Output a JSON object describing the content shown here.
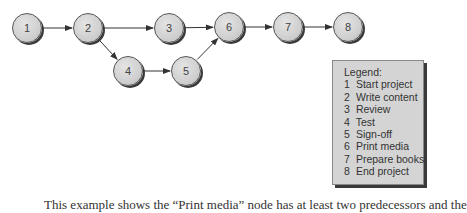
{
  "diagram": {
    "type": "network-diagram",
    "nodes": [
      {
        "id": "1",
        "label": "1",
        "x": 27,
        "y": 28
      },
      {
        "id": "2",
        "label": "2",
        "x": 88,
        "y": 28
      },
      {
        "id": "3",
        "label": "3",
        "x": 169,
        "y": 28
      },
      {
        "id": "4",
        "label": "4",
        "x": 128,
        "y": 71
      },
      {
        "id": "5",
        "label": "5",
        "x": 186,
        "y": 71
      },
      {
        "id": "6",
        "label": "6",
        "x": 229,
        "y": 27
      },
      {
        "id": "7",
        "label": "7",
        "x": 288,
        "y": 27
      },
      {
        "id": "8",
        "label": "8",
        "x": 348,
        "y": 27
      }
    ],
    "edges": [
      {
        "from": "1",
        "to": "2"
      },
      {
        "from": "2",
        "to": "3"
      },
      {
        "from": "2",
        "to": "4"
      },
      {
        "from": "3",
        "to": "6"
      },
      {
        "from": "4",
        "to": "5"
      },
      {
        "from": "5",
        "to": "6"
      },
      {
        "from": "6",
        "to": "7"
      },
      {
        "from": "7",
        "to": "8"
      }
    ]
  },
  "legend": {
    "title": "Legend:",
    "items": [
      {
        "num": "1",
        "label": "Start project"
      },
      {
        "num": "2",
        "label": "Write content"
      },
      {
        "num": "3",
        "label": "Review"
      },
      {
        "num": "4",
        "label": "Test"
      },
      {
        "num": "5",
        "label": "Sign-off"
      },
      {
        "num": "6",
        "label": "Print media"
      },
      {
        "num": "7",
        "label": "Prepare books"
      },
      {
        "num": "8",
        "label": "End project"
      }
    ]
  },
  "caption": {
    "text": "This example shows the “Print media” node has at least two predecessors and the"
  }
}
